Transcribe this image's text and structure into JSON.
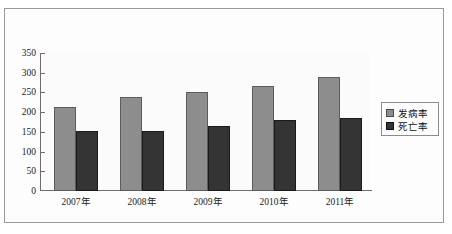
{
  "chart_data": {
    "type": "bar",
    "title": "",
    "subtitle": "",
    "xlabel": "",
    "ylabel": "",
    "categories": [
      "2007年",
      "2008年",
      "2009年",
      "2010年",
      "2011年"
    ],
    "series": [
      {
        "name": "发病率",
        "color": "#8d8d8d",
        "values": [
          212,
          238,
          251,
          266,
          289
        ]
      },
      {
        "name": "死亡率",
        "color": "#343434",
        "values": [
          151,
          153,
          166,
          180,
          185
        ]
      }
    ],
    "ylim": [
      0,
      350
    ],
    "ytick_labels": [
      "350",
      "300",
      "250",
      "200",
      "150",
      "100",
      "50",
      "0"
    ],
    "ytick_values": [
      350,
      300,
      250,
      200,
      150,
      100,
      50,
      0
    ],
    "grid": false,
    "legend_position": "right",
    "legend": [
      "发病率",
      "死亡率"
    ]
  }
}
